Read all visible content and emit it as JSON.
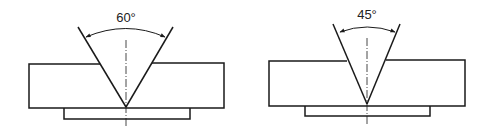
{
  "diagrams": [
    {
      "name": "groove-60",
      "angle_label": "60°",
      "angle_deg": 60
    },
    {
      "name": "groove-45",
      "angle_label": "45°",
      "angle_deg": 45
    }
  ],
  "colors": {
    "line": "#1a1a1a",
    "background": "#ffffff"
  }
}
